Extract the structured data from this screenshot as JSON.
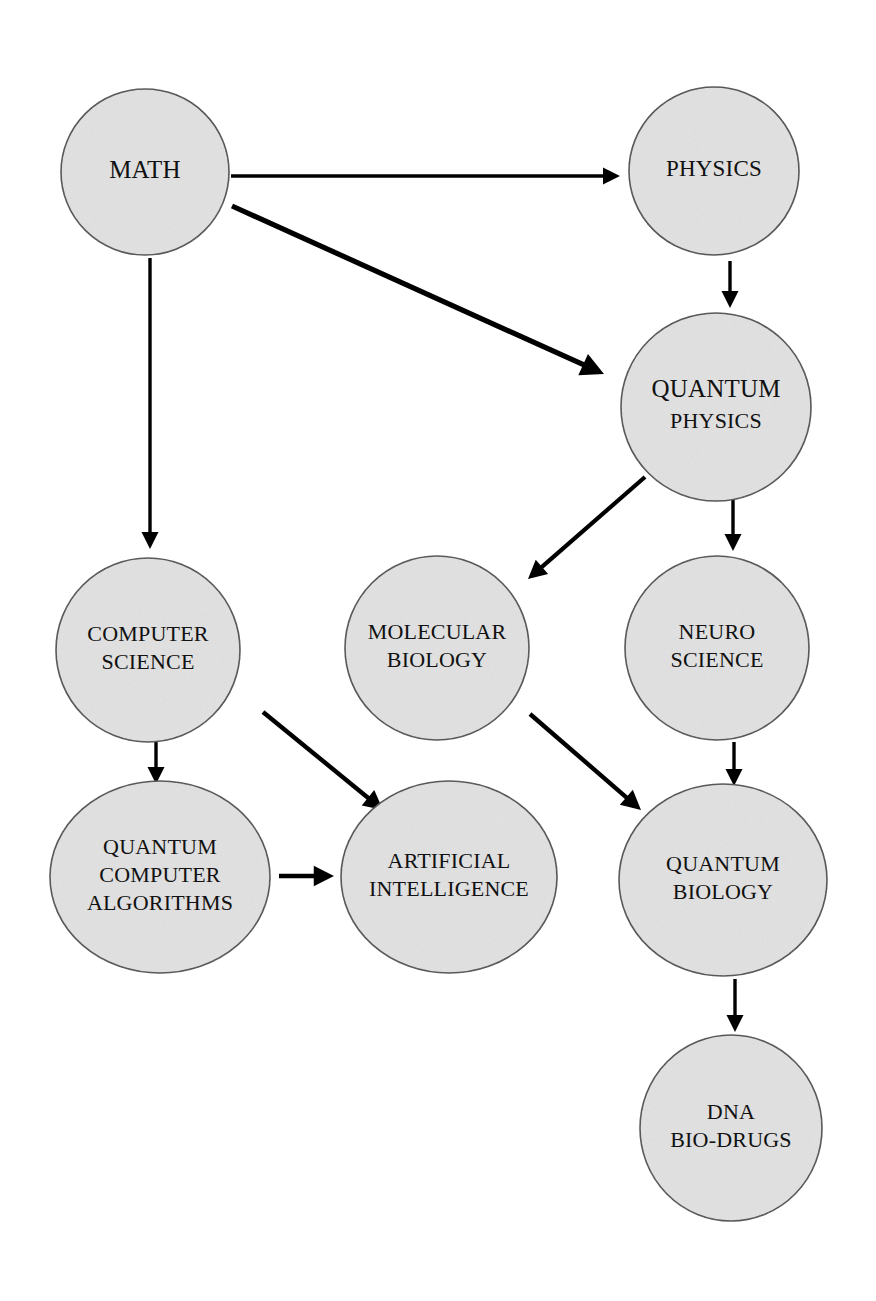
{
  "diagram": {
    "background_color": "#ffffff",
    "node_fill": "#e2e2e2",
    "node_stroke": "#4a4a4a",
    "edge_color": "#000000",
    "text_color": "#111111",
    "nodes": [
      {
        "id": "math",
        "lines": [
          "MATH"
        ],
        "cx": 145,
        "cy": 172,
        "rx": 84,
        "ry": 83,
        "font_size": 25
      },
      {
        "id": "physics",
        "lines": [
          "PHYSICS"
        ],
        "cx": 714,
        "cy": 171,
        "rx": 85,
        "ry": 84,
        "font_size": 23
      },
      {
        "id": "quantum-physics",
        "lines": [
          "QUANTUM",
          "PHYSICS"
        ],
        "cx": 716,
        "cy": 407,
        "rx": 95,
        "ry": 94,
        "font_size": 25,
        "line_font_sizes": [
          25,
          22
        ]
      },
      {
        "id": "computer-science",
        "lines": [
          "COMPUTER",
          "SCIENCE"
        ],
        "cx": 148,
        "cy": 650,
        "rx": 92,
        "ry": 92,
        "font_size": 22
      },
      {
        "id": "molecular-biology",
        "lines": [
          "MOLECULAR",
          "BIOLOGY"
        ],
        "cx": 437,
        "cy": 648,
        "rx": 92,
        "ry": 92,
        "font_size": 22
      },
      {
        "id": "neuro-science",
        "lines": [
          "NEURO",
          "SCIENCE"
        ],
        "cx": 717,
        "cy": 648,
        "rx": 92,
        "ry": 92,
        "font_size": 22
      },
      {
        "id": "quantum-computer-algorithms",
        "lines": [
          "QUANTUM",
          "COMPUTER",
          "ALGORITHMS"
        ],
        "cx": 160,
        "cy": 877,
        "rx": 110,
        "ry": 96,
        "font_size": 22
      },
      {
        "id": "artificial-intelligence",
        "lines": [
          "ARTIFICIAL",
          "INTELLIGENCE"
        ],
        "cx": 449,
        "cy": 877,
        "rx": 108,
        "ry": 96,
        "font_size": 22
      },
      {
        "id": "quantum-biology",
        "lines": [
          "QUANTUM",
          "BIOLOGY"
        ],
        "cx": 723,
        "cy": 880,
        "rx": 104,
        "ry": 96,
        "font_size": 22
      },
      {
        "id": "dna-bio-drugs",
        "lines": [
          "DNA",
          "BIO-DRUGS"
        ],
        "cx": 731,
        "cy": 1128,
        "rx": 91,
        "ry": 93,
        "font_size": 22
      }
    ],
    "edges": [
      {
        "id": "math-to-physics",
        "from": "MATH",
        "to": "PHYSICS",
        "x1": 231,
        "y1": 176,
        "x2": 620,
        "y2": 176,
        "width": 3.4
      },
      {
        "id": "math-to-quantum-physics",
        "from": "MATH",
        "to": "QUANTUM PHYSICS",
        "x1": 232,
        "y1": 206,
        "x2": 604,
        "y2": 374,
        "width": 5.2
      },
      {
        "id": "math-to-computer-science",
        "from": "MATH",
        "to": "COMPUTER SCIENCE",
        "x1": 150,
        "y1": 258,
        "x2": 150,
        "y2": 549,
        "width": 3.4
      },
      {
        "id": "physics-to-quantum-physics",
        "from": "PHYSICS",
        "to": "QUANTUM PHYSICS",
        "x1": 730,
        "y1": 261,
        "x2": 730,
        "y2": 308,
        "width": 3.4
      },
      {
        "id": "quantum-physics-to-molecular-biology",
        "from": "QUANTUM PHYSICS",
        "to": "MOLECULAR BIOLOGY",
        "x1": 645,
        "y1": 477,
        "x2": 528,
        "y2": 579,
        "width": 4.2
      },
      {
        "id": "quantum-physics-to-neuro-science",
        "from": "QUANTUM PHYSICS",
        "to": "NEURO SCIENCE",
        "x1": 733,
        "y1": 500,
        "x2": 733,
        "y2": 551,
        "width": 3.4
      },
      {
        "id": "computer-science-to-quantum-computer-algorithms",
        "from": "COMPUTER SCIENCE",
        "to": "QUANTUM COMPUTER ALGORITHMS",
        "x1": 156,
        "y1": 728,
        "x2": 156,
        "y2": 784,
        "width": 3.4
      },
      {
        "id": "computer-science-to-artificial-intelligence",
        "from": "COMPUTER SCIENCE",
        "to": "ARTIFICIAL INTELLIGENCE",
        "x1": 263,
        "y1": 712,
        "x2": 383,
        "y2": 810,
        "width": 4.4
      },
      {
        "id": "molecular-biology-to-quantum-biology",
        "from": "MOLECULAR BIOLOGY",
        "to": "QUANTUM BIOLOGY",
        "x1": 530,
        "y1": 714,
        "x2": 641,
        "y2": 810,
        "width": 4.4
      },
      {
        "id": "neuro-science-to-quantum-biology",
        "from": "NEURO SCIENCE",
        "to": "QUANTUM BIOLOGY",
        "x1": 734,
        "y1": 742,
        "x2": 734,
        "y2": 786,
        "width": 3.4
      },
      {
        "id": "quantum-computer-algorithms-to-artificial-intelligence",
        "from": "QUANTUM COMPUTER ALGORITHMS",
        "to": "ARTIFICIAL INTELLIGENCE",
        "x1": 279,
        "y1": 876,
        "x2": 334,
        "y2": 876,
        "width": 4.6
      },
      {
        "id": "quantum-biology-to-dna-bio-drugs",
        "from": "QUANTUM BIOLOGY",
        "to": "DNA BIO-DRUGS",
        "x1": 735,
        "y1": 979,
        "x2": 735,
        "y2": 1032,
        "width": 3.4
      }
    ]
  }
}
